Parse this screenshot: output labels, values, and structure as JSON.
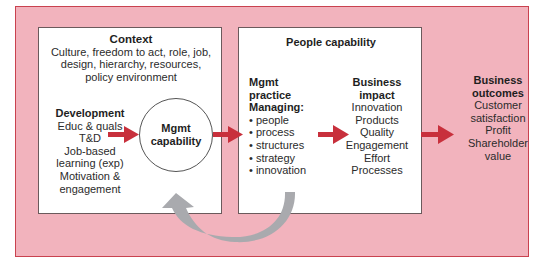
{
  "colors": {
    "background_panel": "#f2b3bd",
    "panel_border": "#c9424f",
    "arrow_red": "#c8303c",
    "arrow_grey": "#a9aaae"
  },
  "context": {
    "title": "Context",
    "lines": [
      "Culture, freedom to act, role, job,",
      "design, hierarchy, resources,",
      "policy environment"
    ]
  },
  "development": {
    "title": "Development",
    "lines": [
      "Educ & quals",
      "T&D",
      "Job-based",
      "learning (exp)",
      "Motivation &",
      "engagement"
    ]
  },
  "mgmt_capability": {
    "line1": "Mgmt",
    "line2": "capability"
  },
  "people_capability": {
    "title": "People capability"
  },
  "mgmt_practice": {
    "title_lines": [
      "Mgmt",
      "practice",
      "Managing:"
    ],
    "items": [
      "• people",
      "• process",
      "• structures",
      "• strategy",
      "• innovation"
    ]
  },
  "business_impact": {
    "title_lines": [
      "Business",
      "impact"
    ],
    "items": [
      "Innovation",
      "Products",
      "Quality",
      "Engagement",
      "Effort",
      "Processes"
    ]
  },
  "business_outcomes": {
    "title_lines": [
      "Business",
      "outcomes"
    ],
    "items": [
      "Customer",
      "satisfaction",
      "Profit",
      "Shareholder",
      "value"
    ]
  }
}
